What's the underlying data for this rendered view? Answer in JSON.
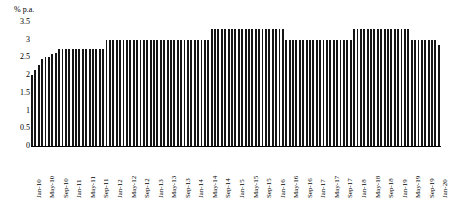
{
  "chart_data": {
    "type": "bar",
    "title": "",
    "xlabel": "",
    "ylabel": "% p.a.",
    "ylim": [
      0,
      3.5
    ],
    "grid": false,
    "legend": null,
    "y_ticks": [
      "3.5",
      "3",
      "2.5",
      "2",
      "1.5",
      "1",
      "0.5",
      "0"
    ],
    "y_tick_values": [
      3.5,
      3,
      2.5,
      2,
      1.5,
      1,
      0.5,
      0
    ],
    "x_tick_labels": [
      "Jan-10",
      "May-10",
      "Sep-10",
      "Jan-11",
      "May-11",
      "Sep-11",
      "Jan-12",
      "May-12",
      "Sep-12",
      "Jan-13",
      "May-13",
      "Sep-13",
      "Jan-14",
      "May-14",
      "Sep-14",
      "Jan-15",
      "May-15",
      "Sep-15",
      "Jan-16",
      "May-16",
      "Sep-16",
      "Jan-17",
      "May-17",
      "Sep-17",
      "Jan-18",
      "May-18",
      "Sep-18",
      "Jan-19",
      "May-19",
      "Sep-19",
      "Jan-20"
    ],
    "x_tick_interval_months": 4,
    "categories": [
      "Jan-10",
      "Feb-10",
      "Mar-10",
      "Apr-10",
      "May-10",
      "Jun-10",
      "Jul-10",
      "Aug-10",
      "Sep-10",
      "Oct-10",
      "Nov-10",
      "Dec-10",
      "Jan-11",
      "Feb-11",
      "Mar-11",
      "Apr-11",
      "May-11",
      "Jun-11",
      "Jul-11",
      "Aug-11",
      "Sep-11",
      "Oct-11",
      "Nov-11",
      "Dec-11",
      "Jan-12",
      "Feb-12",
      "Mar-12",
      "Apr-12",
      "May-12",
      "Jun-12",
      "Jul-12",
      "Aug-12",
      "Sep-12",
      "Oct-12",
      "Nov-12",
      "Dec-12",
      "Jan-13",
      "Feb-13",
      "Mar-13",
      "Apr-13",
      "May-13",
      "Jun-13",
      "Jul-13",
      "Aug-13",
      "Sep-13",
      "Oct-13",
      "Nov-13",
      "Dec-13",
      "Jan-14",
      "Feb-14",
      "Mar-14",
      "Apr-14",
      "May-14",
      "Jun-14",
      "Jul-14",
      "Aug-14",
      "Sep-14",
      "Oct-14",
      "Nov-14",
      "Dec-14",
      "Jan-15",
      "Feb-15",
      "Mar-15",
      "Apr-15",
      "May-15",
      "Jun-15",
      "Jul-15",
      "Aug-15",
      "Sep-15",
      "Oct-15",
      "Nov-15",
      "Dec-15",
      "Jan-16",
      "Feb-16",
      "Mar-16",
      "Apr-16",
      "May-16",
      "Jun-16",
      "Jul-16",
      "Aug-16",
      "Sep-16",
      "Oct-16",
      "Nov-16",
      "Dec-16",
      "Jan-17",
      "Feb-17",
      "Mar-17",
      "Apr-17",
      "May-17",
      "Jun-17",
      "Jul-17",
      "Aug-17",
      "Sep-17",
      "Oct-17",
      "Nov-17",
      "Dec-17",
      "Jan-18",
      "Feb-18",
      "Mar-18",
      "Apr-18",
      "May-18",
      "Jun-18",
      "Jul-18",
      "Aug-18",
      "Sep-18",
      "Oct-18",
      "Nov-18",
      "Dec-18",
      "Jan-19",
      "Feb-19",
      "Mar-19",
      "Apr-19",
      "May-19",
      "Jun-19",
      "Jul-19",
      "Aug-19",
      "Sep-19",
      "Oct-19",
      "Nov-19",
      "Dec-19",
      "Jan-20"
    ],
    "values": [
      2.0,
      2.15,
      2.3,
      2.45,
      2.5,
      2.52,
      2.6,
      2.62,
      2.75,
      2.75,
      2.75,
      2.75,
      2.75,
      2.75,
      2.75,
      2.75,
      2.75,
      2.75,
      2.75,
      2.75,
      2.75,
      2.75,
      3.0,
      3.0,
      3.0,
      3.0,
      3.0,
      3.0,
      3.0,
      3.0,
      3.0,
      3.0,
      3.0,
      3.0,
      3.0,
      3.0,
      3.0,
      3.0,
      3.0,
      3.0,
      3.0,
      3.0,
      3.0,
      3.0,
      3.0,
      3.0,
      3.0,
      3.0,
      3.0,
      3.0,
      3.0,
      3.0,
      3.0,
      3.3,
      3.3,
      3.3,
      3.3,
      3.3,
      3.3,
      3.3,
      3.3,
      3.3,
      3.3,
      3.3,
      3.3,
      3.3,
      3.3,
      3.3,
      3.3,
      3.3,
      3.3,
      3.3,
      3.3,
      3.3,
      3.3,
      3.0,
      3.0,
      3.0,
      3.0,
      3.0,
      3.0,
      3.0,
      3.0,
      3.0,
      3.0,
      3.0,
      3.0,
      3.0,
      3.0,
      3.0,
      3.0,
      3.0,
      3.0,
      3.0,
      3.0,
      3.3,
      3.3,
      3.3,
      3.3,
      3.3,
      3.3,
      3.3,
      3.3,
      3.3,
      3.3,
      3.3,
      3.3,
      3.3,
      3.3,
      3.3,
      3.3,
      3.3,
      3.0,
      3.0,
      3.0,
      3.0,
      3.0,
      3.0,
      3.0,
      3.0,
      2.85
    ]
  }
}
